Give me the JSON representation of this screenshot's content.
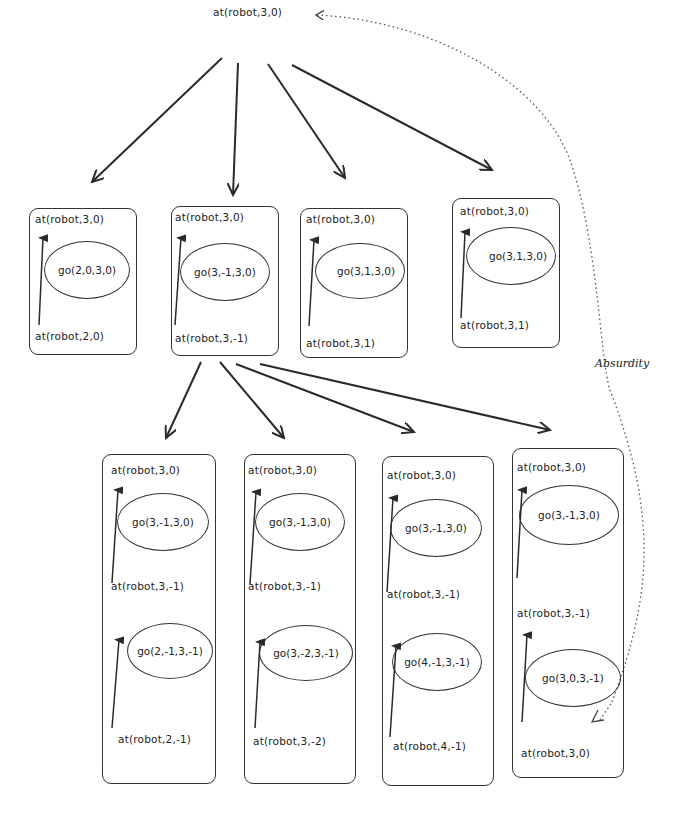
{
  "root": {
    "label": "at(robot,3,0)",
    "x": 213,
    "y": 6
  },
  "absurdity_label": "Absurdity",
  "level1": [
    {
      "id": "n1",
      "top": "at(robot,3,0)",
      "action": "go(2,0,3,0)",
      "bottom": "at(robot,2,0)",
      "box": [
        29,
        208,
        108,
        147
      ]
    },
    {
      "id": "n2",
      "top": "at(robot,3,0)",
      "action": "go(3,-1,3,0)",
      "bottom": "at(robot,3,-1)",
      "box": [
        171,
        206,
        108,
        150
      ]
    },
    {
      "id": "n3",
      "top": "at(robot,3,0)",
      "action": "go(3,1,3,0)",
      "bottom": "at(robot,3,1)",
      "box": [
        300,
        208,
        108,
        150
      ]
    },
    {
      "id": "n4",
      "top": "at(robot,3,0)",
      "action": "go(3,1,3,0)",
      "bottom": "at(robot,3,1)",
      "box": [
        452,
        198,
        108,
        150
      ]
    }
  ],
  "level2": [
    {
      "id": "m1",
      "steps": [
        {
          "top": "at(robot,3,0)",
          "action": "go(3,-1,3,0)"
        },
        {
          "top": "at(robot,3,-1)",
          "action": "go(2,-1,3,-1)"
        }
      ],
      "bottom": "at(robot,2,-1)",
      "box": [
        102,
        454,
        114,
        330
      ]
    },
    {
      "id": "m2",
      "steps": [
        {
          "top": "at(robot,3,0)",
          "action": "go(3,-1,3,0)"
        },
        {
          "top": "at(robot,3,-1)",
          "action": "go(3,-2,3,-1)"
        }
      ],
      "bottom": "at(robot,3,-2)",
      "box": [
        244,
        454,
        112,
        330
      ]
    },
    {
      "id": "m3",
      "steps": [
        {
          "top": "at(robot,3,0)",
          "action": "go(3,-1,3,0)"
        },
        {
          "top": "at(robot,3,-1)",
          "action": "go(4,-1,3,-1)"
        }
      ],
      "bottom": "at(robot,4,-1)",
      "box": [
        382,
        456,
        112,
        330
      ]
    },
    {
      "id": "m4",
      "steps": [
        {
          "top": "at(robot,3,0)",
          "action": "go(3,-1,3,0)"
        },
        {
          "top": "at(robot,3,-1)",
          "action": "go(3,0,3,-1)"
        }
      ],
      "bottom": "at(robot,3,0)",
      "box": [
        512,
        448,
        112,
        330
      ]
    }
  ]
}
